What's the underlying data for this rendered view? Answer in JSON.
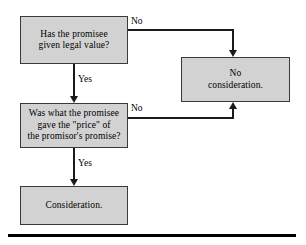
{
  "diagram": {
    "fill_color": "#d2d2d2",
    "border_color": "#3a3a3a",
    "line_color": "#1a1a1a",
    "background_color": "#ffffff",
    "nodes": {
      "legal_value": "Has the promisee\ngiven legal value?",
      "price_promise": "Was what the promisee\ngave the \"price\" of\nthe promisor's promise?",
      "no_consideration": "No\nconsideration.",
      "consideration": "Consideration."
    },
    "edge_labels": {
      "no_top": "No",
      "no_mid": "No",
      "yes_top": "Yes",
      "yes_bottom": "Yes"
    }
  }
}
